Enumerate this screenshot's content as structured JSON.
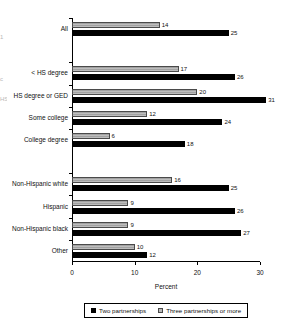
{
  "chart_data": {
    "type": "bar",
    "orientation": "horizontal",
    "title": "",
    "xlabel": "Percent",
    "ylabel": "",
    "xlim": [
      0,
      30
    ],
    "xticks": [
      0,
      10,
      20,
      30
    ],
    "grid": false,
    "legend_position": "bottom",
    "categories": [
      "All",
      "< HS degree",
      "HS degree or GED",
      "Some college",
      "College degree",
      "Non-Hispanic white",
      "Hispanic",
      "Non-Hispanic black",
      "Other"
    ],
    "series": [
      {
        "name": "Two partnerships",
        "color": "#000000",
        "values": [
          25,
          26,
          31,
          24,
          18,
          25,
          26,
          27,
          12
        ]
      },
      {
        "name": "Three partnerships or more",
        "color": "#b0b0b0",
        "values": [
          14,
          17,
          20,
          12,
          6,
          16,
          9,
          9,
          10
        ]
      }
    ],
    "blocks": [
      {
        "name": "overall",
        "categories": [
          "All"
        ]
      },
      {
        "name": "education",
        "categories": [
          "< HS degree",
          "HS degree or GED",
          "Some college",
          "College degree"
        ]
      },
      {
        "name": "race-ethnicity",
        "categories": [
          "Non-Hispanic white",
          "Hispanic",
          "Non-Hispanic black",
          "Other"
        ]
      }
    ]
  },
  "legend": {
    "items": [
      {
        "label": "Two partnerships",
        "swatch": "black-square-icon"
      },
      {
        "label": "Three partnerships or more",
        "swatch": "gray-square-icon"
      }
    ]
  },
  "axis": {
    "x_title": "Percent",
    "x_tick_labels": [
      "0",
      "10",
      "20",
      "30"
    ]
  },
  "edge_artifacts": [
    "1",
    "c",
    "HS"
  ]
}
